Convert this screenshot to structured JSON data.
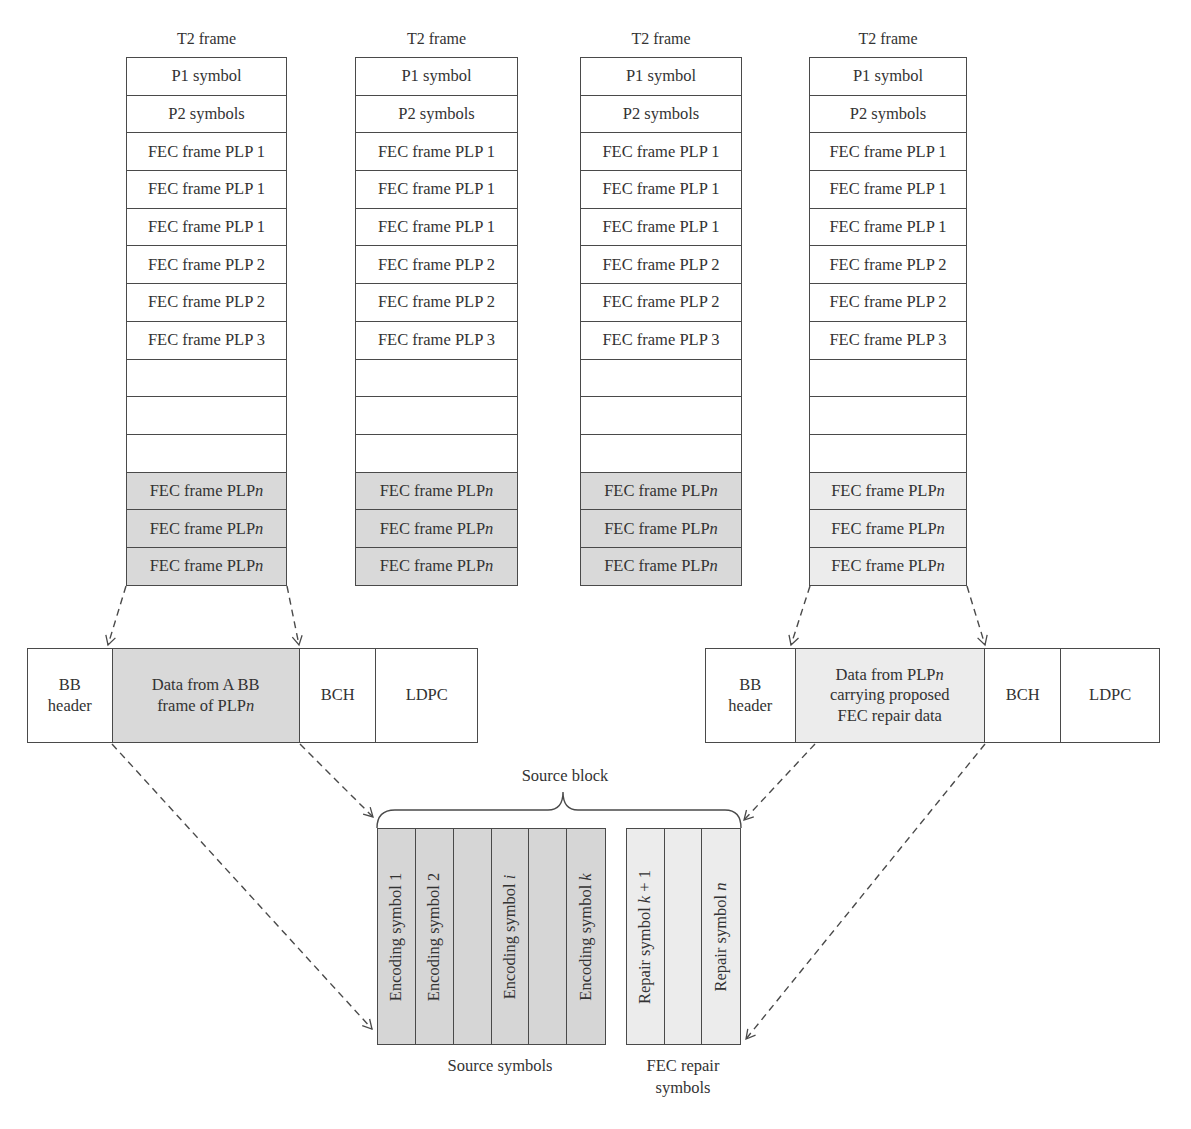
{
  "t2_frames": [
    {
      "title": "T2 frame",
      "rows": [
        {
          "label": "P1 symbol",
          "fill": "white"
        },
        {
          "label": "P2 symbols",
          "fill": "white"
        },
        {
          "label": "FEC frame PLP 1",
          "fill": "white"
        },
        {
          "label": "FEC frame PLP 1",
          "fill": "white"
        },
        {
          "label": "FEC frame PLP 1",
          "fill": "white"
        },
        {
          "label": "FEC frame PLP 2",
          "fill": "white"
        },
        {
          "label": "FEC frame PLP 2",
          "fill": "white"
        },
        {
          "label": "FEC frame PLP 3",
          "fill": "white"
        },
        {
          "label": "",
          "fill": "white"
        },
        {
          "label": "",
          "fill": "white"
        },
        {
          "label": "",
          "fill": "white"
        },
        {
          "label": "FEC frame PLP",
          "suffix": "n",
          "fill": "gray"
        },
        {
          "label": "FEC frame PLP",
          "suffix": "n",
          "fill": "gray"
        },
        {
          "label": "FEC frame PLP",
          "suffix": "n",
          "fill": "gray"
        }
      ]
    },
    {
      "title": "T2 frame",
      "rows": [
        {
          "label": "P1 symbol",
          "fill": "white"
        },
        {
          "label": "P2 symbols",
          "fill": "white"
        },
        {
          "label": "FEC frame PLP 1",
          "fill": "white"
        },
        {
          "label": "FEC frame PLP 1",
          "fill": "white"
        },
        {
          "label": "FEC frame PLP 1",
          "fill": "white"
        },
        {
          "label": "FEC frame PLP 2",
          "fill": "white"
        },
        {
          "label": "FEC frame PLP 2",
          "fill": "white"
        },
        {
          "label": "FEC frame PLP 3",
          "fill": "white"
        },
        {
          "label": "",
          "fill": "white"
        },
        {
          "label": "",
          "fill": "white"
        },
        {
          "label": "",
          "fill": "white"
        },
        {
          "label": "FEC frame PLP",
          "suffix": "n",
          "fill": "gray"
        },
        {
          "label": "FEC frame PLP",
          "suffix": "n",
          "fill": "gray"
        },
        {
          "label": "FEC frame PLP",
          "suffix": "n",
          "fill": "gray"
        }
      ]
    },
    {
      "title": "T2 frame",
      "rows": [
        {
          "label": "P1 symbol",
          "fill": "white"
        },
        {
          "label": "P2 symbols",
          "fill": "white"
        },
        {
          "label": "FEC frame PLP 1",
          "fill": "white"
        },
        {
          "label": "FEC frame PLP 1",
          "fill": "white"
        },
        {
          "label": "FEC frame PLP 1",
          "fill": "white"
        },
        {
          "label": "FEC frame PLP 2",
          "fill": "white"
        },
        {
          "label": "FEC frame PLP 2",
          "fill": "white"
        },
        {
          "label": "FEC frame PLP 3",
          "fill": "white"
        },
        {
          "label": "",
          "fill": "white"
        },
        {
          "label": "",
          "fill": "white"
        },
        {
          "label": "",
          "fill": "white"
        },
        {
          "label": "FEC frame PLP",
          "suffix": "n",
          "fill": "gray"
        },
        {
          "label": "FEC frame PLP",
          "suffix": "n",
          "fill": "gray"
        },
        {
          "label": "FEC frame PLP",
          "suffix": "n",
          "fill": "gray"
        }
      ]
    },
    {
      "title": "T2 frame",
      "rows": [
        {
          "label": "P1 symbol",
          "fill": "white"
        },
        {
          "label": "P2 symbols",
          "fill": "white"
        },
        {
          "label": "FEC frame PLP 1",
          "fill": "white"
        },
        {
          "label": "FEC frame PLP 1",
          "fill": "white"
        },
        {
          "label": "FEC frame PLP 1",
          "fill": "white"
        },
        {
          "label": "FEC frame PLP 2",
          "fill": "white"
        },
        {
          "label": "FEC frame PLP 2",
          "fill": "white"
        },
        {
          "label": "FEC frame PLP 3",
          "fill": "white"
        },
        {
          "label": "",
          "fill": "white"
        },
        {
          "label": "",
          "fill": "white"
        },
        {
          "label": "",
          "fill": "white"
        },
        {
          "label": "FEC frame PLP",
          "suffix": "n",
          "fill": "light"
        },
        {
          "label": "FEC frame PLP",
          "suffix": "n",
          "fill": "light"
        },
        {
          "label": "FEC frame PLP",
          "suffix": "n",
          "fill": "light"
        }
      ]
    }
  ],
  "bb_frame_left": {
    "header": [
      "BB",
      "header"
    ],
    "data": [
      "Data from A BB",
      "frame of PLP",
      "n"
    ],
    "bch": "BCH",
    "ldpc": "LDPC"
  },
  "bb_frame_right": {
    "header": [
      "BB",
      "header"
    ],
    "data": [
      "Data from PLP",
      "n",
      "carrying proposed",
      "FEC repair data"
    ],
    "bch": "BCH",
    "ldpc": "LDPC"
  },
  "source_block": {
    "label": "Source block",
    "source_symbols": [
      "Encoding symbol 1",
      "Encoding symbol 2",
      "",
      "Encoding symbol i",
      "",
      "Encoding symbol k"
    ],
    "repair_symbols": [
      "Repair symbol k + 1",
      "",
      "Repair symbol n"
    ],
    "source_caption": "Source symbols",
    "repair_caption": [
      "FEC repair",
      "symbols"
    ]
  },
  "colors": {
    "line": "#4a4a4a",
    "gray_fill": "#d9d9d9",
    "light_fill": "#ececec",
    "text": "#333333"
  }
}
